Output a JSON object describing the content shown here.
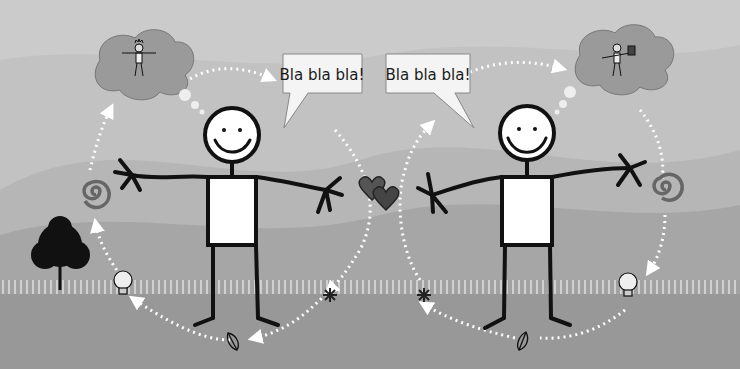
{
  "scene": {
    "description": "Two stick figures exchanging thoughts and speech in a cycle",
    "colors": {
      "sky_light": "#c4c4c4",
      "hill_mid": "#b4b4b4",
      "hill_dark": "#9e9e9e",
      "ground": "#959595",
      "line": "#111111",
      "white": "#ffffff",
      "heart": "#4a4a4a",
      "spiral": "#6a6a6a"
    }
  },
  "speech_bubbles": [
    {
      "text": "Bla bla bla!"
    },
    {
      "text": "Bla bla bla!"
    }
  ],
  "figures": [
    {
      "label": "left-person",
      "thought": "person wearing crown"
    },
    {
      "label": "right-person",
      "thought": "person holding mug"
    }
  ],
  "icons": [
    "thought-cloud",
    "spiral",
    "lightbulb",
    "leaf",
    "sparkle",
    "hearts",
    "tree"
  ]
}
